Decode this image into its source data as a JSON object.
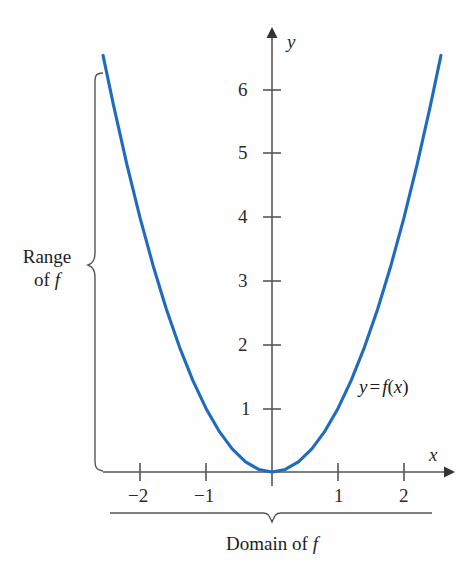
{
  "figure": {
    "kind": "cartesian-plot",
    "curve_color": "#1f6bc0",
    "axis_color": "#555555",
    "text_color": "#1d1d1d",
    "curve_label": {
      "lhs": "y",
      "eq": "=",
      "fn": "f",
      "open": "(",
      "arg": "x",
      "close": ")",
      "full": "y = f(x)"
    },
    "axis_labels": {
      "x": "x",
      "y": "y"
    },
    "annotations": {
      "range": {
        "line1": "Range",
        "line2_prefix": "of",
        "line2_symbol": "f"
      },
      "domain": {
        "prefix": "Domain of",
        "symbol": "f"
      }
    }
  },
  "chart_data": {
    "type": "line",
    "title": "",
    "subtitle": "",
    "xlabel": "x",
    "ylabel": "y",
    "legend": [
      "y = f(x)"
    ],
    "legend_position": "inline-right",
    "grid": false,
    "xlim": [
      -2.6,
      2.65
    ],
    "ylim": [
      -0.45,
      6.7
    ],
    "xticks": [
      -2,
      -1,
      1,
      2
    ],
    "xtick_labels": [
      "−2",
      "−1",
      "1",
      "2"
    ],
    "yticks": [
      1,
      2,
      3,
      4,
      5,
      6
    ],
    "ytick_labels": [
      "1",
      "2",
      "3",
      "4",
      "5",
      "6"
    ],
    "equation": "y = x^2",
    "series": [
      {
        "name": "y = f(x)",
        "color": "#1f6bc0",
        "x": [
          -2.56,
          -2.4,
          -2.2,
          -2.0,
          -1.8,
          -1.6,
          -1.4,
          -1.2,
          -1.0,
          -0.8,
          -0.6,
          -0.4,
          -0.2,
          0.0,
          0.2,
          0.4,
          0.6,
          0.8,
          1.0,
          1.2,
          1.4,
          1.6,
          1.8,
          2.0,
          2.2,
          2.4,
          2.56
        ],
        "values": [
          6.55,
          5.76,
          4.84,
          4.0,
          3.24,
          2.56,
          1.96,
          1.44,
          1.0,
          0.64,
          0.36,
          0.16,
          0.04,
          0.0,
          0.04,
          0.16,
          0.36,
          0.64,
          1.0,
          1.44,
          1.96,
          2.56,
          3.24,
          4.0,
          4.84,
          5.76,
          6.55
        ]
      }
    ],
    "annotations": [
      {
        "text": "Range of f",
        "orientation": "vertical-brace-left",
        "spans": [
          0,
          6.55
        ]
      },
      {
        "text": "Domain of f",
        "orientation": "horizontal-brace-bottom",
        "spans": [
          -2.45,
          2.4
        ]
      }
    ]
  }
}
